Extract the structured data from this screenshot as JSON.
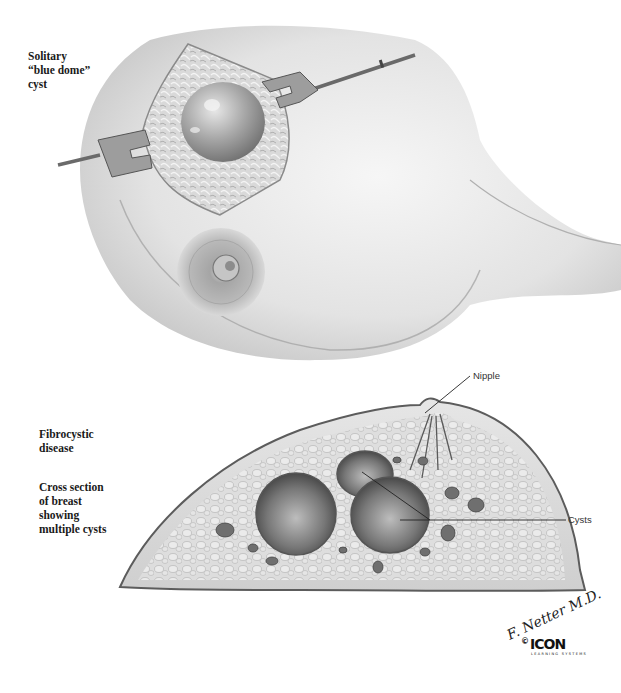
{
  "illustration": {
    "top_panel": {
      "caption": "Solitary\n“blue dome”\ncyst"
    },
    "bottom_panel": {
      "caption_1": "Fibrocystic\ndisease",
      "caption_2": "Cross section\nof breast\nshowing\nmultiple cysts",
      "callouts": {
        "nipple": "Nipple",
        "cysts": "Cysts"
      }
    },
    "credits": {
      "signature": "F. Netter M.D.",
      "copyright_symbol": "©",
      "publisher_logo": "ICON",
      "publisher_sub": "LEARNING SYSTEMS"
    }
  }
}
